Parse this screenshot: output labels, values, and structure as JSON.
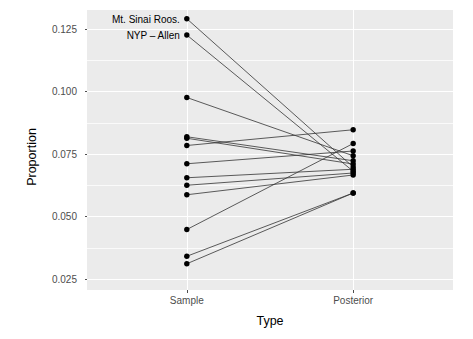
{
  "chart_data": {
    "type": "line",
    "title": "",
    "subtitle": "",
    "xlabel": "Type",
    "ylabel": "Proportion",
    "categories": [
      "Sample",
      "Posterior"
    ],
    "x_tick_labels": [
      "Sample",
      "Posterior"
    ],
    "y_tick_labels": [
      "0.025",
      "0.050",
      "0.075",
      "0.100",
      "0.125"
    ],
    "y_tick_values": [
      0.025,
      0.05,
      0.075,
      0.1,
      0.125
    ],
    "y_minor_tick_values": [
      0.0375,
      0.0625,
      0.0875,
      0.1125
    ],
    "ylim": [
      0.0205,
      0.1325
    ],
    "grid": true,
    "legend": "none",
    "style": "slope-chart paired points connected by line segments",
    "point_color": "#000000",
    "line_color": "#333333",
    "panel_background": "#EBEBEB",
    "grid_color": "#FFFFFF",
    "series": [
      {
        "name": "Mt. Sinai Roos.",
        "values": [
          0.129,
          0.0697
        ],
        "labeled": true
      },
      {
        "name": "NYP - Allen",
        "values": [
          0.1225,
          0.068
        ],
        "labeled": true
      },
      {
        "name": "hospital-3",
        "values": [
          0.0975,
          0.0742
        ],
        "labeled": false
      },
      {
        "name": "hospital-4",
        "values": [
          0.0818,
          0.0722
        ],
        "labeled": false
      },
      {
        "name": "hospital-5",
        "values": [
          0.0812,
          0.0709
        ],
        "labeled": false
      },
      {
        "name": "hospital-6",
        "values": [
          0.0783,
          0.0846
        ],
        "labeled": false
      },
      {
        "name": "hospital-7",
        "values": [
          0.071,
          0.0761
        ],
        "labeled": false
      },
      {
        "name": "hospital-8",
        "values": [
          0.0654,
          0.0688
        ],
        "labeled": false
      },
      {
        "name": "hospital-9",
        "values": [
          0.0624,
          0.0673
        ],
        "labeled": false
      },
      {
        "name": "hospital-10",
        "values": [
          0.0586,
          0.0665
        ],
        "labeled": false
      },
      {
        "name": "hospital-11",
        "values": [
          0.0447,
          0.0791
        ],
        "labeled": false
      },
      {
        "name": "hospital-12",
        "values": [
          0.034,
          0.0593
        ],
        "labeled": false
      },
      {
        "name": "hospital-13",
        "values": [
          0.031,
          0.0593
        ],
        "labeled": false
      }
    ],
    "annotations": [
      {
        "text": "Mt. Sinai Roos.",
        "x": "Sample",
        "y": 0.129
      },
      {
        "text": "NYP – Allen",
        "x": "Sample",
        "y": 0.1225
      }
    ]
  }
}
